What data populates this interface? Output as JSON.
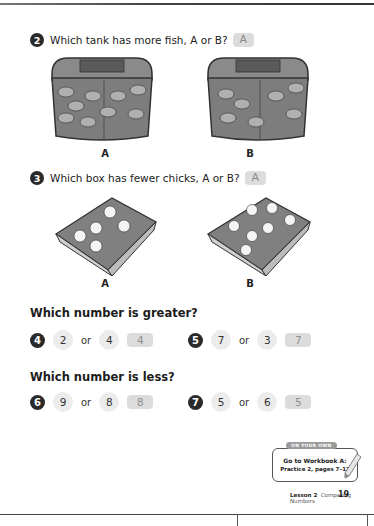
{
  "question2": {
    "number": "2",
    "text": "Which tank has more fish, A or B?",
    "answer": "A",
    "figures": [
      {
        "label": "A",
        "item": "fish tank",
        "count": 9
      },
      {
        "label": "B",
        "item": "fish tank",
        "count": 7
      }
    ]
  },
  "question3": {
    "number": "3",
    "text": "Which box has fewer chicks, A or B?",
    "answer": "A",
    "figures": [
      {
        "label": "A",
        "item": "box of chicks",
        "count": 5
      },
      {
        "label": "B",
        "item": "box of chicks",
        "count": 7
      }
    ]
  },
  "greater": {
    "heading": "Which number is greater?",
    "items": [
      {
        "number": "4",
        "a": "2",
        "or": "or",
        "b": "4",
        "answer": "4"
      },
      {
        "number": "5",
        "a": "7",
        "or": "or",
        "b": "3",
        "answer": "7"
      }
    ]
  },
  "less": {
    "heading": "Which number is less?",
    "items": [
      {
        "number": "6",
        "a": "9",
        "or": "or",
        "b": "8",
        "answer": "8"
      },
      {
        "number": "7",
        "a": "5",
        "or": "or",
        "b": "6",
        "answer": "5"
      }
    ]
  },
  "on_your_own": {
    "tab": "ON YOUR OWN",
    "line1": "Go to Workbook A:",
    "line2": "Practice 2, pages 7–12"
  },
  "footer": {
    "lesson": "Lesson 2",
    "title": "Comparing Numbers",
    "page": "19"
  }
}
